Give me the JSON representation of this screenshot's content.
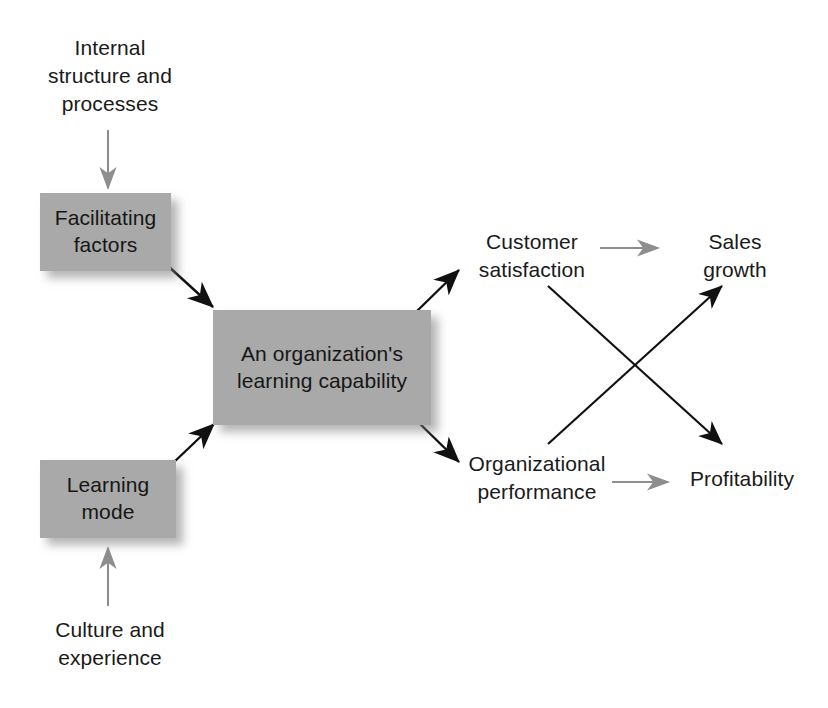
{
  "diagram": {
    "colors": {
      "box_fill": "#a9a9a9",
      "box_text": "#161616",
      "label_text": "#1a1a1a",
      "strong_arrow": "#111111",
      "soft_arrow": "#8e8e8e",
      "background": "#ffffff"
    },
    "boxes": [
      {
        "id": "facilitating-factors",
        "text": "Facilitating\nfactors",
        "x": 40,
        "y": 193,
        "w": 131,
        "h": 78
      },
      {
        "id": "learning-capability",
        "text": "An organization's\nlearning\ncapability",
        "x": 213,
        "y": 310,
        "w": 218,
        "h": 115
      },
      {
        "id": "learning-mode",
        "text": "Learning\nmode",
        "x": 40,
        "y": 460,
        "w": 136,
        "h": 78
      }
    ],
    "labels": [
      {
        "id": "internal-structure-and-processes",
        "text": "Internal\nstructure and\nprocesses",
        "x": 20,
        "y": 34,
        "w": 180
      },
      {
        "id": "culture-and-experience",
        "text": "Culture and\nexperience",
        "x": 20,
        "y": 616,
        "w": 180
      },
      {
        "id": "customer-satisfaction",
        "text": "Customer\nsatisfaction",
        "x": 452,
        "y": 228,
        "w": 160
      },
      {
        "id": "sales-growth",
        "text": "Sales\ngrowth",
        "x": 665,
        "y": 228,
        "w": 140
      },
      {
        "id": "organizational-performance",
        "text": "Organizational\nperformance",
        "x": 452,
        "y": 450,
        "w": 170
      },
      {
        "id": "profitability",
        "text": "Profitability",
        "x": 672,
        "y": 465,
        "w": 140
      }
    ],
    "connectors": [
      {
        "id": "internal-structure-to-facilitating-factors",
        "from": "Internal structure and processes",
        "to": "Facilitating factors",
        "style": "soft"
      },
      {
        "id": "culture-to-learning-mode",
        "from": "Culture and experience",
        "to": "Learning mode",
        "style": "soft"
      },
      {
        "id": "facilitating-factors-to-learning-capability",
        "from": "Facilitating factors",
        "to": "An organization's learning capability",
        "style": "strong"
      },
      {
        "id": "learning-mode-to-learning-capability",
        "from": "Learning mode",
        "to": "An organization's learning capability",
        "style": "strong"
      },
      {
        "id": "learning-capability-to-customer-satisfaction",
        "from": "An organization's learning capability",
        "to": "Customer satisfaction",
        "style": "strong"
      },
      {
        "id": "learning-capability-to-organizational-performance",
        "from": "An organization's learning capability",
        "to": "Organizational performance",
        "style": "strong"
      },
      {
        "id": "customer-satisfaction-to-sales-growth",
        "from": "Customer satisfaction",
        "to": "Sales growth",
        "style": "soft"
      },
      {
        "id": "organizational-performance-to-profitability",
        "from": "Organizational performance",
        "to": "Profitability",
        "style": "soft"
      },
      {
        "id": "customer-satisfaction-to-profitability",
        "from": "Customer satisfaction",
        "to": "Profitability",
        "style": "strong"
      },
      {
        "id": "organizational-performance-to-sales-growth",
        "from": "Organizational performance",
        "to": "Sales growth",
        "style": "strong"
      }
    ]
  }
}
